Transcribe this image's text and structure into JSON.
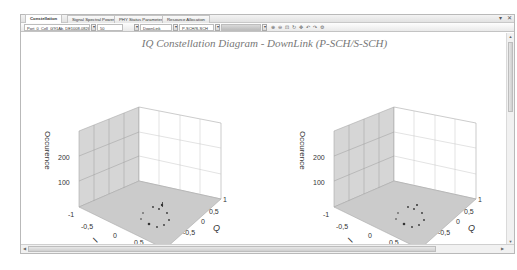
{
  "tabs": [
    {
      "label": "Constellation",
      "active": true
    },
    {
      "label": "Signal Spectral Power",
      "active": false
    },
    {
      "label": "PHY Status Parameter",
      "active": false
    },
    {
      "label": "Resource Allocation",
      "active": false
    }
  ],
  "window_controls": {
    "pin": "▾",
    "close": "✕"
  },
  "toolbar": {
    "cell_select": "Port_0_Cell_0(91Ab, DE1008-0826,",
    "count_select": "50",
    "direction_select": "DownLink",
    "channel_select": "P-SCH/S-SCH",
    "range_select": "",
    "icons": [
      "zoom-in",
      "zoom-out",
      "zoom-fit",
      "rotate",
      "pan",
      "undo",
      "redo",
      "settings"
    ]
  },
  "main": {
    "title": "IQ Constellation Diagram - DownLink (P-SCH/S-SCH)"
  },
  "plots": [
    {
      "id": "left",
      "zlabel": "Occurence",
      "xlabel": "I",
      "ylabel": "Q",
      "zticks": [
        "100",
        "200"
      ],
      "xticks": [
        "-1",
        "-0,5",
        "0",
        "0,5",
        "1"
      ],
      "yticks": [
        "-1",
        "-0,5",
        "0",
        "0,5",
        "1"
      ]
    },
    {
      "id": "right",
      "zlabel": "Occurence",
      "xlabel": "I",
      "ylabel": "Q",
      "zticks": [
        "100",
        "200"
      ],
      "xticks": [
        "-1",
        "-0,5",
        "0",
        "0,5",
        "1"
      ],
      "yticks": [
        "-1",
        "-0,5",
        "0",
        "0,5",
        "1"
      ]
    }
  ],
  "colors": {
    "floor": "#c9c9c9",
    "wall": "#d8d8d8",
    "grid": "#a9a9a9",
    "title": "#777777",
    "points": "#333333"
  }
}
